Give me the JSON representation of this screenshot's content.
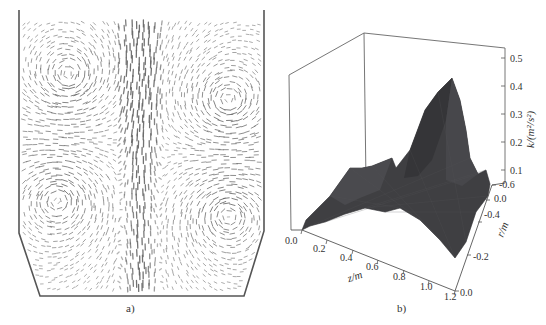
{
  "figure": {
    "panel_a": {
      "caption": "a)",
      "description": "velocity vector field in vessel with four main recirculation vortices"
    },
    "panel_b": {
      "caption": "b)"
    }
  },
  "chart_data": [
    {
      "type": "vector-field",
      "panel": "a)",
      "title": "",
      "features": {
        "vortices": [
          "upper-left",
          "upper-right",
          "lower-left",
          "lower-right"
        ],
        "central_jet": "vertical dense flow along centerline",
        "vessel_shape": "vertical walls with chamfered bottom corners"
      },
      "colors": {
        "arrows": "#6b6b6b",
        "walls": "#555555"
      }
    },
    {
      "type": "surface3d",
      "panel": "b)",
      "title": "",
      "xlabel": "z/m",
      "ylabel": "r/m",
      "zlabel": "k/(m²/s²)",
      "x_ticks": [
        "0.0",
        "0.2",
        "0.4",
        "0.6",
        "0.8",
        "1.0",
        "1.2"
      ],
      "y_ticks": [
        "0.0",
        "-0.2",
        "-0.4",
        "0.0",
        "-0.6"
      ],
      "z_ticks": [
        "0.1",
        "0.2",
        "0.3",
        "0.4",
        "0.5"
      ],
      "xlim": [
        0.0,
        1.2
      ],
      "ylim": [
        -0.6,
        0.0
      ],
      "zlim": [
        0.0,
        0.5
      ],
      "peak": {
        "z": 0.85,
        "r": -0.55,
        "k": 0.44
      },
      "secondary_ridge": {
        "z_range": [
          0.2,
          0.6
        ],
        "k": 0.13
      },
      "baseline_k": 0.05,
      "grid": false,
      "colors": {
        "surface": "#3f3f42",
        "axes": "#555555"
      }
    }
  ],
  "labels": {
    "z_axis": {
      "k": "k",
      "unit": "/(m",
      "sup": "2",
      "mid": "/s",
      "sup2": "2",
      "close": ")"
    },
    "zlabel_text": "k/(m²/s²)",
    "xlabel_text": "z/m",
    "ylabel_text": "r/m",
    "ztick_0": "0.1",
    "ztick_1": "0.2",
    "ztick_2": "0.3",
    "ztick_3": "0.4",
    "ztick_4": "0.5",
    "xtick_0": "0.0",
    "xtick_1": "0.2",
    "xtick_2": "0.4",
    "xtick_3": "0.6",
    "xtick_4": "0.8",
    "xtick_5": "1.0",
    "xtick_6": "1.2",
    "ytick_0": "-0.6",
    "ytick_1": "0.0",
    "ytick_2": "-0.4",
    "ytick_3": "-0.2",
    "ytick_4": "0.0"
  }
}
